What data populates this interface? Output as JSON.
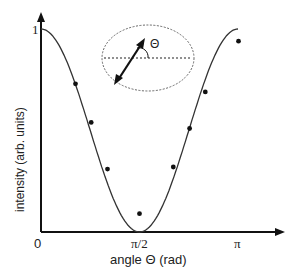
{
  "chart_data": {
    "type": "line",
    "title": "",
    "xlabel": "angle Θ (rad)",
    "ylabel": "intensity (arb. units)",
    "xlim": [
      0,
      3.3
    ],
    "ylim": [
      0,
      1.07
    ],
    "x_ticks": [
      {
        "value": 0,
        "label": "0"
      },
      {
        "value": 1.5708,
        "label": "π/2"
      },
      {
        "value": 3.1416,
        "label": "π"
      }
    ],
    "y_ticks": [
      {
        "value": 0,
        "label": "0"
      },
      {
        "value": 1,
        "label": "1"
      }
    ],
    "grid": false,
    "legend": null,
    "series": [
      {
        "name": "fit cos²Θ",
        "kind": "line",
        "formula": "cos^2(theta)",
        "x": [
          0,
          0.3927,
          0.7854,
          1.1781,
          1.5708,
          1.9635,
          2.3562,
          2.7489,
          3.1416
        ],
        "values": [
          1.0,
          0.854,
          0.5,
          0.146,
          0.0,
          0.146,
          0.5,
          0.854,
          1.0
        ]
      },
      {
        "name": "measured",
        "kind": "scatter",
        "x": [
          0.55,
          0.8,
          1.06,
          1.57,
          2.11,
          2.37,
          2.62,
          3.15
        ],
        "values": [
          0.73,
          0.54,
          0.31,
          0.09,
          0.32,
          0.51,
          0.69,
          0.94
        ]
      }
    ],
    "annotations": [
      {
        "type": "inset",
        "description": "dotted ellipse with double-headed arrow at angle Θ to dashed horizontal line",
        "label": "Θ"
      }
    ]
  },
  "labels": {
    "x_axis": "angle Θ (rad)",
    "y_axis": "intensity (arb. units)",
    "x_tick_0": "0",
    "x_tick_half_pi": "π/2",
    "x_tick_pi": "π",
    "y_tick_1": "1",
    "inset_theta": "Θ"
  }
}
